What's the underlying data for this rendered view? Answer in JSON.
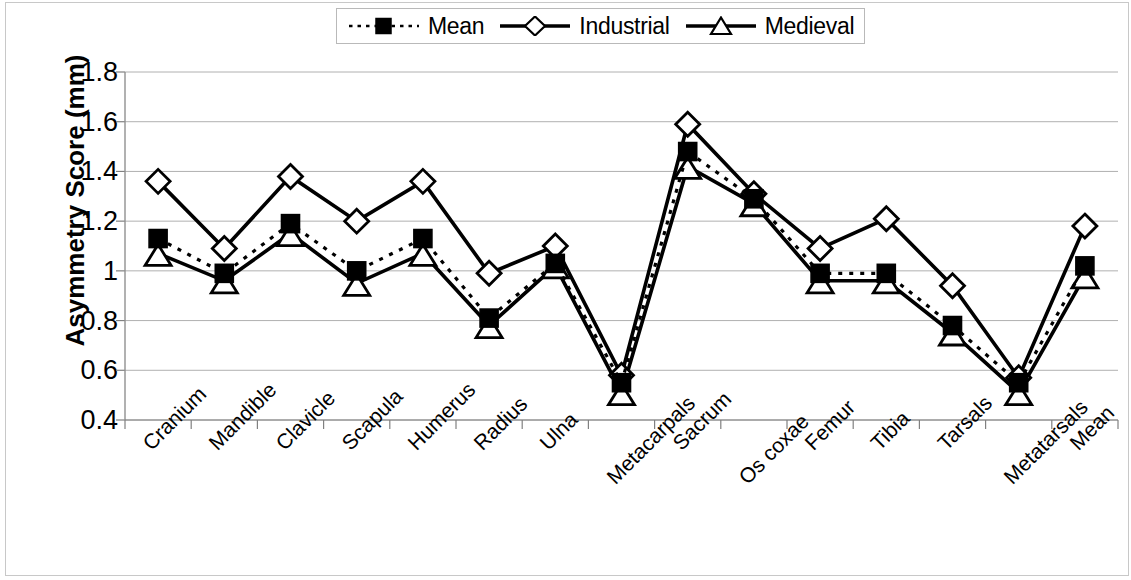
{
  "chart_data": {
    "type": "line",
    "title": "",
    "xlabel": "",
    "ylabel": "Asymmetry Score  (mm)",
    "ylim": [
      0.4,
      1.8
    ],
    "ytick_step": 0.2,
    "ytick_labels": [
      "1.8",
      "1.6",
      "1.4",
      "1.2",
      "1",
      "0.8",
      "0.6",
      "0.4"
    ],
    "ytick_values": [
      1.8,
      1.6,
      1.4,
      1.2,
      1.0,
      0.8,
      0.6,
      0.4
    ],
    "grid": true,
    "legend_position": "top-center",
    "categories": [
      "Cranium",
      "Mandible",
      "Clavicle",
      "Scapula",
      "Humerus",
      "Radius",
      "Ulna",
      "Metacarpals",
      "Sacrum",
      "Os coxae",
      "Femur",
      "Tibia",
      "Tarsals",
      "Metatarsals",
      "Mean"
    ],
    "series": [
      {
        "name": "Mean",
        "marker": "filled-square",
        "line": "dotted",
        "color": "#000000",
        "values": [
          1.13,
          0.99,
          1.19,
          1.0,
          1.13,
          0.81,
          1.03,
          0.55,
          1.48,
          1.29,
          0.99,
          0.99,
          0.78,
          0.55,
          1.02
        ]
      },
      {
        "name": "Industrial",
        "marker": "open-diamond",
        "line": "solid",
        "color": "#000000",
        "values": [
          1.36,
          1.09,
          1.38,
          1.2,
          1.36,
          0.99,
          1.1,
          0.58,
          1.59,
          1.31,
          1.09,
          1.21,
          0.94,
          0.57,
          1.18
        ]
      },
      {
        "name": "Medieval",
        "marker": "open-triangle",
        "line": "solid",
        "color": "#000000",
        "values": [
          1.07,
          0.96,
          1.15,
          0.95,
          1.07,
          0.78,
          1.02,
          0.51,
          1.42,
          1.27,
          0.96,
          0.96,
          0.75,
          0.51,
          0.98
        ]
      }
    ]
  },
  "legend": {
    "entries": [
      {
        "label": "Mean"
      },
      {
        "label": "Industrial"
      },
      {
        "label": "Medieval"
      }
    ]
  },
  "axis": {
    "y_title": "Asymmetry Score  (mm)"
  }
}
